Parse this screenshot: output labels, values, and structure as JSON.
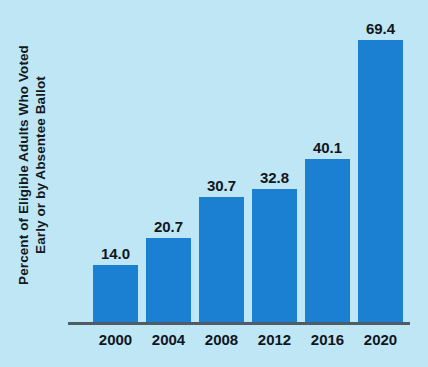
{
  "chart_data": {
    "type": "bar",
    "title": "",
    "xlabel": "",
    "ylabel": "Percent of Eligible Adults Who Voted Early or by Absentee Ballot",
    "ylabel_lines": [
      "Percent of Eligible Adults Who Voted",
      "Early or by Absentee Ballot"
    ],
    "categories": [
      "2000",
      "2004",
      "2008",
      "2012",
      "2016",
      "2020"
    ],
    "values": [
      14.0,
      20.7,
      30.7,
      32.8,
      40.1,
      69.4
    ],
    "value_labels": [
      "14.0",
      "20.7",
      "30.7",
      "32.8",
      "40.1",
      "69.4"
    ],
    "ylim": [
      0,
      69.4
    ],
    "grid": false,
    "legend": null,
    "bar_color": "#1b7fd2",
    "background_color": "#bfe6f5",
    "text_color": "#10161e",
    "axis_color": "#4f5c68"
  }
}
